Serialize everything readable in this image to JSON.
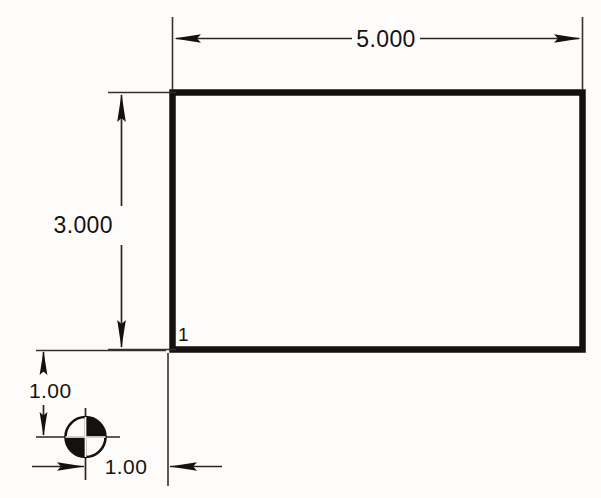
{
  "drawing": {
    "title": "Engineering part dimension drawing",
    "background_color": "#fdfcfa",
    "line_color": "#15110e",
    "part": {
      "shape": "rectangle",
      "label": "1",
      "label_name": "datum-feature-label"
    },
    "dimensions": {
      "width": {
        "value": "5.000",
        "name": "overall-width-dimension",
        "orientation": "horizontal",
        "position": "top"
      },
      "height": {
        "value": "3.000",
        "name": "overall-height-dimension",
        "orientation": "vertical",
        "position": "left"
      },
      "datum_offset_vertical": {
        "value": "1.00",
        "name": "datum-vertical-offset-dimension",
        "orientation": "vertical",
        "position": "lower-left"
      },
      "datum_offset_horizontal": {
        "value": "1.00",
        "name": "datum-horizontal-offset-dimension",
        "orientation": "horizontal",
        "position": "bottom"
      }
    },
    "symbols": {
      "datum_target": {
        "name": "datum-target-point-symbol",
        "description": "quartered circle with upper-right and lower-left quadrants filled"
      }
    }
  }
}
